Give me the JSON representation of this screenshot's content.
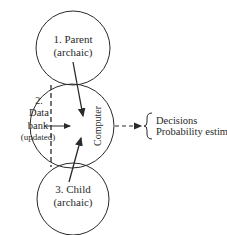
{
  "diagram": {
    "parent": {
      "line1": "1.  Parent",
      "line2": "(archaic)"
    },
    "data_bank": {
      "line1": "2.",
      "line2": "Data",
      "line3": "bank",
      "line4": "(updated)"
    },
    "computer": {
      "label": "Computer"
    },
    "child": {
      "line1": "3.  Child",
      "line2": "(archaic)"
    },
    "outputs": [
      "Decisions",
      "Probability estimating"
    ],
    "colors": {
      "stroke": "#2a2a2a",
      "background": "#ffffff"
    }
  }
}
